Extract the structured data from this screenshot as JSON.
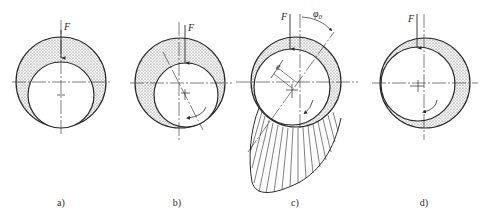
{
  "figure": {
    "type": "journal-bearing-lubrication-stages",
    "colors": {
      "line": "#2a2a2a",
      "oil_film": "#d9d9d9",
      "background": "#ffffff"
    },
    "panels": [
      {
        "id": "a",
        "caption": "a)",
        "force_label": "F",
        "state": "at rest"
      },
      {
        "id": "b",
        "caption": "b)",
        "force_label": "F",
        "state": "start-up, journal climbs"
      },
      {
        "id": "c",
        "caption": "c)",
        "force_label": "F",
        "eccentricity_label": "e",
        "angle_label": "φ",
        "angle_subscript": "0",
        "state": "stable hydrodynamic with pressure distribution"
      },
      {
        "id": "d",
        "caption": "d)",
        "force_label": "F",
        "state": "high speed, near concentric"
      }
    ]
  }
}
